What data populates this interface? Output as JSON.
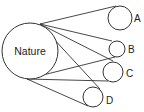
{
  "diagram": {
    "title": "",
    "center": {
      "id": "nature",
      "label": "Nature"
    },
    "leaves": [
      {
        "id": "A",
        "label": "A"
      },
      {
        "id": "B",
        "label": "B"
      },
      {
        "id": "C",
        "label": "C"
      },
      {
        "id": "D",
        "label": "D"
      }
    ],
    "connections": [
      {
        "from": "nature",
        "to": "A"
      },
      {
        "from": "nature",
        "to": "B"
      },
      {
        "from": "nature",
        "to": "C"
      },
      {
        "from": "nature",
        "to": "D"
      }
    ],
    "stroke_color": "#333333"
  }
}
